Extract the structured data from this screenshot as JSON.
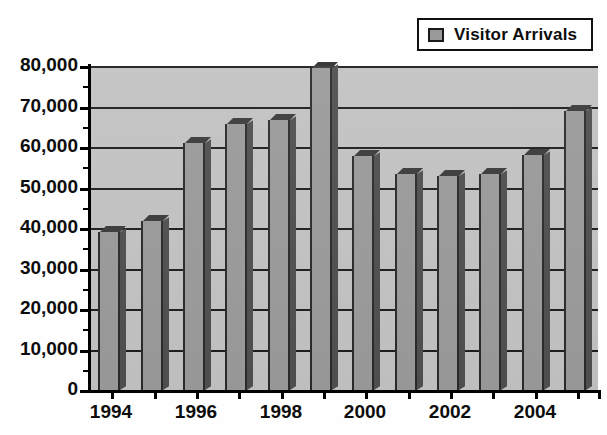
{
  "legend": {
    "label": "Visitor Arrivals",
    "swatch_icon": "gray-square-swatch",
    "position": "top-right",
    "swatch_color": "#9a9a9a",
    "border_color": "#111111"
  },
  "colors": {
    "plot_background": "#c2c2c2",
    "bar_fill": "#9a9a9a",
    "bar_shadow": "#4f4f4f",
    "bar_top": "#3a3a3a",
    "gridline": "#1d1d1d",
    "axis": "#000000",
    "page_background": "#ffffff",
    "text": "#0d0d0d"
  },
  "chart_data": {
    "type": "bar",
    "title": "",
    "xlabel": "",
    "ylabel": "",
    "grid": true,
    "legend_position": "top-right",
    "ylim": [
      0,
      80000
    ],
    "ytick_step": 10000,
    "categories": [
      "1994",
      "1995",
      "1996",
      "1997",
      "1998",
      "1999",
      "2000",
      "2001",
      "2002",
      "2003",
      "2004",
      "2005"
    ],
    "xtick_labels_shown": [
      "1994",
      "1996",
      "1998",
      "2000",
      "2002",
      "2004"
    ],
    "ytick_labels": [
      "0",
      "10,000",
      "20,000",
      "30,000",
      "40,000",
      "50,000",
      "60,000",
      "70,000",
      "80,000"
    ],
    "ytick_values": [
      0,
      10000,
      20000,
      30000,
      40000,
      50000,
      60000,
      70000,
      80000
    ],
    "series": [
      {
        "name": "Visitor Arrivals",
        "values": [
          39000,
          41700,
          60900,
          65600,
          66600,
          79500,
          57900,
          53400,
          52900,
          53400,
          58100,
          68800
        ]
      }
    ]
  }
}
